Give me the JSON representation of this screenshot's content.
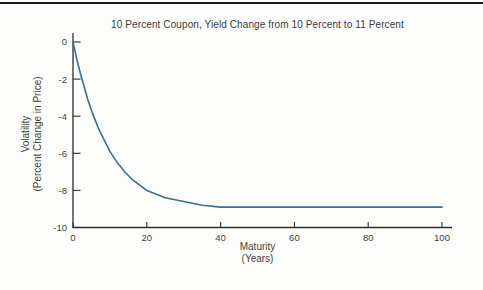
{
  "figure": {
    "background_color": "#fdfdfb",
    "top_rule_color": "#1c1c1c"
  },
  "chart_data": {
    "type": "line",
    "title": "10 Percent Coupon, Yield Change from 10 Percent to 11 Percent",
    "xlabel_line1": "Maturity",
    "xlabel_line2": "(Years)",
    "ylabel_line1": "Volatility",
    "ylabel_line2": "(Percent Change in Price)",
    "xlim": [
      0,
      100
    ],
    "ylim": [
      -10,
      0
    ],
    "x_ticks": [
      0,
      20,
      40,
      60,
      80,
      100
    ],
    "x_tick_labels": [
      "0",
      "20",
      "40",
      "60",
      "80",
      "100"
    ],
    "y_ticks": [
      0,
      -2,
      -4,
      -6,
      -8,
      -10
    ],
    "y_tick_labels": [
      "0",
      "-2",
      "-4",
      "-6",
      "-8",
      "-10"
    ],
    "grid": false,
    "legend": "none",
    "line_color": "#3e6e8c",
    "axis_color": "#2e2e2e",
    "text_color": "#3f3f3f",
    "series": [
      {
        "name": "Volatility (Percent Change in Price)",
        "x": [
          0,
          1,
          2,
          3,
          4,
          5,
          6,
          7,
          8,
          9,
          10,
          12,
          14,
          16,
          18,
          20,
          25,
          30,
          35,
          40,
          50,
          60,
          70,
          80,
          90,
          100
        ],
        "y": [
          0,
          -0.9,
          -1.7,
          -2.4,
          -3.1,
          -3.7,
          -4.2,
          -4.7,
          -5.1,
          -5.5,
          -5.9,
          -6.5,
          -7.0,
          -7.4,
          -7.7,
          -8.0,
          -8.4,
          -8.6,
          -8.8,
          -8.9,
          -8.9,
          -8.9,
          -8.9,
          -8.9,
          -8.9,
          -8.9
        ]
      }
    ]
  }
}
